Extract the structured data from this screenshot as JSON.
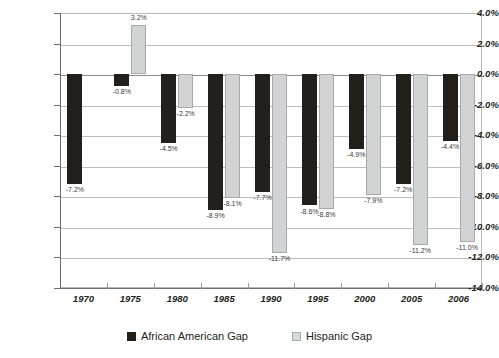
{
  "chart_data": {
    "type": "bar",
    "title": "",
    "xlabel": "",
    "ylabel": "",
    "categories": [
      "1970",
      "1975",
      "1980",
      "1985",
      "1990",
      "1995",
      "2000",
      "2005",
      "2006"
    ],
    "series": [
      {
        "name": "African American Gap",
        "color": "#231f1a",
        "values": [
          -7.2,
          -0.8,
          -4.5,
          -8.9,
          -7.7,
          -8.6,
          -4.9,
          -7.2,
          -4.4
        ],
        "labels": [
          "-7.2%",
          "-0.8%",
          "-4.5%",
          "-8.9%",
          "-7.7%",
          "-8.6%",
          "-4.9%",
          "-7.2%",
          "-4.4%"
        ]
      },
      {
        "name": "Hispanic Gap",
        "color": "#d2d3d5",
        "values": [
          null,
          3.2,
          -2.2,
          -8.1,
          -11.7,
          -8.8,
          -7.9,
          -11.2,
          -11.0
        ],
        "labels": [
          "",
          "3.2%",
          "-2.2%",
          "-8.1%",
          "-11.7%",
          "-8.8%",
          "-7.9%",
          "-11.2%",
          "-11.0%"
        ]
      }
    ],
    "ylim": [
      -14.0,
      4.0
    ],
    "ytick_values": [
      4.0,
      2.0,
      0.0,
      -2.0,
      -4.0,
      -6.0,
      -8.0,
      -10.0,
      -12.0,
      -14.0
    ],
    "ytick_labels": [
      "4.0%",
      "2.0%",
      "0.0%",
      "-2.0%",
      "-4.0%",
      "-6.0%",
      "-8.0%",
      "-10.0%",
      "-12.0%",
      "-14.0%"
    ],
    "grid": true,
    "legend_position": "bottom"
  },
  "legend": {
    "items": [
      {
        "label": "African American Gap"
      },
      {
        "label": "Hispanic Gap"
      }
    ]
  }
}
